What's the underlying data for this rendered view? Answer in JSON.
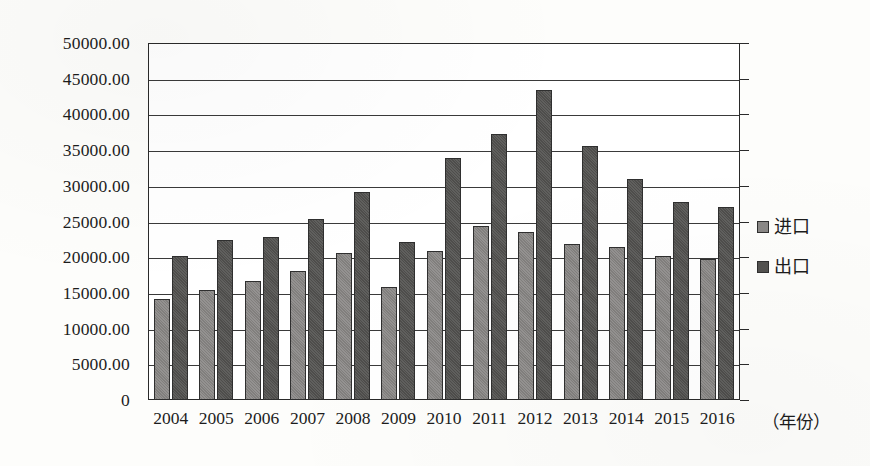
{
  "chart_data": {
    "type": "bar",
    "title": "",
    "xlabel": "（年份）",
    "ylabel": "",
    "categories": [
      "2004",
      "2005",
      "2006",
      "2007",
      "2008",
      "2009",
      "2010",
      "2011",
      "2012",
      "2013",
      "2014",
      "2015",
      "2016"
    ],
    "series": [
      {
        "name": "进口",
        "color": "#888684",
        "values": [
          14100,
          15400,
          16700,
          18100,
          20600,
          15800,
          20900,
          24400,
          23500,
          21900,
          21500,
          20200,
          19700
        ]
      },
      {
        "name": "出口",
        "color": "#535250",
        "values": [
          20200,
          22400,
          22800,
          25400,
          29200,
          22100,
          33900,
          37200,
          43400,
          35600,
          30900,
          27700,
          27100
        ]
      }
    ],
    "ylim": [
      0,
      50000
    ],
    "ytick_step": 5000,
    "ytick_labels": [
      "0",
      "5000.00",
      "10000.00",
      "15000.00",
      "20000.00",
      "25000.00",
      "30000.00",
      "35000.00",
      "40000.00",
      "45000.00",
      "50000.00"
    ],
    "ytick_values": [
      0,
      5000,
      10000,
      15000,
      20000,
      25000,
      30000,
      35000,
      40000,
      45000,
      50000
    ],
    "grid": true,
    "legend_position": "right",
    "legend_entries": [
      "进口",
      "出口"
    ]
  }
}
